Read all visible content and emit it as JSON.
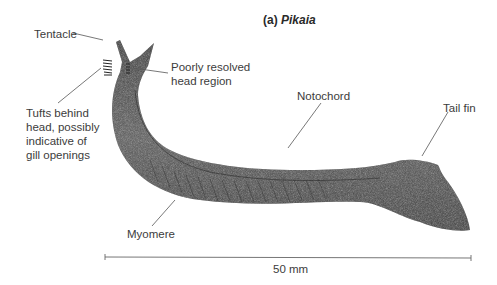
{
  "figure": {
    "title_prefix": "(a)",
    "title_taxon": "Pikaia",
    "labels": {
      "tentacle": "Tentacle",
      "head_line1": "Poorly resolved",
      "head_line2": "head region",
      "tufts_line1": "Tufts behind",
      "tufts_line2": "head, possibly",
      "tufts_line3": "indicative of",
      "tufts_line4": "gill openings",
      "notochord": "Notochord",
      "tail_fin": "Tail fin",
      "myomere": "Myomere"
    },
    "scale_bar": {
      "label": "50 mm"
    },
    "colors": {
      "body": "#4a4a4a",
      "body_dark": "#2e2e2e",
      "lines": "#555555"
    }
  }
}
